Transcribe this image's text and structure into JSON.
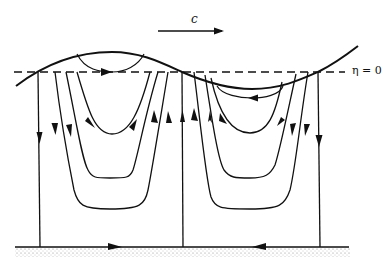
{
  "diagram": {
    "wave_speed_label": "c",
    "mean_level_label": "η = 0",
    "colors": {
      "ink": "#111111",
      "ground": "#bdbdbd",
      "background": "#ffffff"
    }
  }
}
